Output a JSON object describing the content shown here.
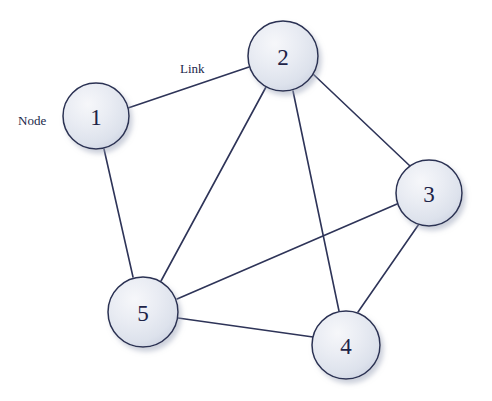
{
  "diagram": {
    "background_color": "#ffffff",
    "width": 492,
    "height": 401
  },
  "style": {
    "node_fill_light": "#f2f4f8",
    "node_fill_mid": "#e3e7ef",
    "node_fill_edge": "#ccd2e0",
    "node_stroke": "#2a3052",
    "node_stroke_width": 1.5,
    "node_shadow": "#b9bfcf",
    "edge_stroke": "#2e3458",
    "edge_stroke_width": 1.6,
    "label_color": "#1d2347",
    "annotation_color": "#21274a"
  },
  "nodes": [
    {
      "id": "1",
      "label": "1",
      "cx": 96,
      "cy": 116,
      "r": 33
    },
    {
      "id": "2",
      "label": "2",
      "cx": 283,
      "cy": 56,
      "r": 35
    },
    {
      "id": "3",
      "label": "3",
      "cx": 429,
      "cy": 193,
      "r": 33
    },
    {
      "id": "4",
      "label": "4",
      "cx": 346,
      "cy": 345,
      "r": 34
    },
    {
      "id": "5",
      "label": "5",
      "cx": 143,
      "cy": 312,
      "r": 35
    }
  ],
  "edges": [
    {
      "id": "e-1-2",
      "from": "1",
      "to": "2",
      "x1": 128,
      "y1": 108,
      "x2": 249,
      "y2": 67
    },
    {
      "id": "e-1-5",
      "from": "1",
      "to": "5",
      "x1": 104,
      "y1": 149,
      "x2": 133,
      "y2": 277
    },
    {
      "id": "e-2-5",
      "from": "2",
      "to": "5",
      "x1": 266,
      "y1": 87,
      "x2": 161,
      "y2": 281
    },
    {
      "id": "e-2-3",
      "from": "2",
      "to": "3",
      "x1": 313,
      "y1": 74,
      "x2": 410,
      "y2": 166
    },
    {
      "id": "e-2-4",
      "from": "2",
      "to": "4",
      "x1": 293,
      "y1": 91,
      "x2": 339,
      "y2": 311
    },
    {
      "id": "e-3-5",
      "from": "3",
      "to": "5",
      "x1": 397,
      "y1": 204,
      "x2": 177,
      "y2": 299
    },
    {
      "id": "e-3-4",
      "from": "3",
      "to": "4",
      "x1": 419,
      "y1": 224,
      "x2": 358,
      "y2": 312
    },
    {
      "id": "e-4-5",
      "from": "4",
      "to": "5",
      "x1": 313,
      "y1": 337,
      "x2": 178,
      "y2": 318
    }
  ],
  "annotations": [
    {
      "id": "node-annotation",
      "text": "Node",
      "x": 18,
      "y": 120,
      "anchor": "start"
    },
    {
      "id": "link-annotation",
      "text": "Link",
      "x": 180,
      "y": 68,
      "anchor": "start"
    }
  ]
}
